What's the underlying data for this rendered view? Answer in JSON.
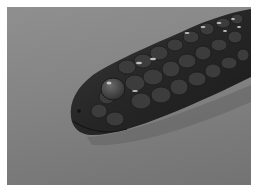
{
  "image": {
    "subject": "Close-up of a dark snake's head with glossy scales against a plain gray background",
    "alt": "Snake head close-up",
    "colors": {
      "border": "#ffffff",
      "background": "#858585",
      "snake_body": "#2a2a2a",
      "scale_highlight": "#d8d8d8"
    }
  }
}
